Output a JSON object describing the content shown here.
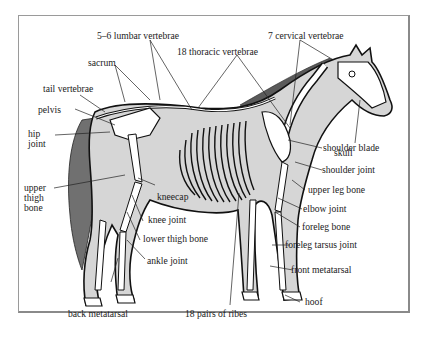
{
  "diagram": {
    "colors": {
      "body_fill": "#d6d6d6",
      "mane_tail": "#707070",
      "bone_fill": "#ffffff",
      "outline": "#111111",
      "frame": "#9a9a9a"
    },
    "labels": {
      "lumbar": "5–6 lumbar vertebrae",
      "thoracic": "18 thoracic vertebrae",
      "cervical": "7 cervical vertebrae",
      "sacrum": "sacrum",
      "tail_vertebrae": "tail vertebrae",
      "pelvis": "pelvis",
      "hip_joint_1": "hip",
      "hip_joint_2": "joint",
      "upper_thigh_1": "upper",
      "upper_thigh_2": "thigh",
      "upper_thigh_3": "bone",
      "kneecap": "kneecap",
      "knee_joint": "knee joint",
      "lower_thigh": "lower thigh bone",
      "ankle_joint": "ankle joint",
      "back_metatarsal": "back metatarsal",
      "ribs": "18 pairs of ribes",
      "skull": "skull",
      "shoulder_blade": "shoulder blade",
      "shoulder_joint": "shoulder joint",
      "upper_leg_bone": "upper leg bone",
      "elbow_joint": "elbow joint",
      "foreleg_bone": "foreleg bone",
      "foreleg_tarsus": "foreleg tarsus joint",
      "front_metatarsal": "front metatarsal",
      "hoof": "hoof"
    }
  }
}
